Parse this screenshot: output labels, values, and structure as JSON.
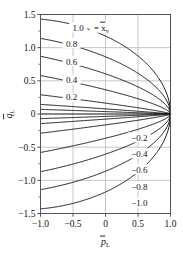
{
  "chart_data": {
    "type": "line",
    "title": "",
    "xlabel": "p̄L",
    "ylabel": "q̄L",
    "xlabel_base": "p",
    "xlabel_sub": "L",
    "ylabel_base": "q",
    "ylabel_sub": "L",
    "xlim": [
      -1.0,
      1.0
    ],
    "ylim": [
      -1.5,
      1.5
    ],
    "grid": true,
    "legend": "inline-curve-labels",
    "legend_title": "x̄v",
    "legend_title_base": "x",
    "legend_title_sub": "v",
    "annotation_equals": "=",
    "xticks": [
      "-1.0",
      "-0.5",
      "0",
      "0.5",
      "1.0"
    ],
    "xtick_values": [
      -1.0,
      -0.5,
      0,
      0.5,
      1.0
    ],
    "yticks": [
      "1.5",
      "1.0",
      "0.5",
      "0",
      "-0.5",
      "-1.0",
      "-1.5"
    ],
    "ytick_values": [
      1.5,
      1.0,
      0.5,
      0,
      -0.5,
      -1.0,
      -1.5
    ],
    "series": [
      {
        "name": "1.0",
        "label": "1.0",
        "label_x": -0.42,
        "label_y": 1.3,
        "start_y": 1.43
      },
      {
        "name": "0.8",
        "label": "0.8",
        "label_x": -0.52,
        "label_y": 1.06,
        "start_y": 1.14
      },
      {
        "name": "0.6",
        "label": "0.6",
        "label_x": -0.52,
        "label_y": 0.79,
        "start_y": 0.87
      },
      {
        "name": "0.4",
        "label": "0.4",
        "label_x": -0.52,
        "label_y": 0.51,
        "start_y": 0.58
      },
      {
        "name": "0.2",
        "label": "0.2",
        "label_x": -0.52,
        "label_y": 0.25,
        "start_y": 0.29
      },
      {
        "name": "0.1",
        "label": "",
        "label_x": 0,
        "label_y": 0,
        "start_y": 0.145
      },
      {
        "name": "0.05",
        "label": "",
        "label_x": 0,
        "label_y": 0,
        "start_y": 0.07
      },
      {
        "name": "0.0",
        "label": "",
        "label_x": 0,
        "label_y": 0,
        "start_y": 0.0
      },
      {
        "name": "-0.05",
        "label": "",
        "label_x": 0,
        "label_y": 0,
        "start_y": -0.07
      },
      {
        "name": "-0.1",
        "label": "",
        "label_x": 0,
        "label_y": 0,
        "start_y": -0.145
      },
      {
        "name": "-0.2",
        "label": "-0.2",
        "label_x": 0.52,
        "label_y": -0.36,
        "start_y": -0.29
      },
      {
        "name": "-0.4",
        "label": "-0.4",
        "label_x": 0.52,
        "label_y": -0.6,
        "start_y": -0.58
      },
      {
        "name": "-0.6",
        "label": "-0.6",
        "label_x": 0.52,
        "label_y": -0.84,
        "start_y": -0.87
      },
      {
        "name": "-0.8",
        "label": "-0.8",
        "label_x": 0.52,
        "label_y": -1.1,
        "start_y": -1.14
      },
      {
        "name": "-1.0",
        "label": "-1.0",
        "label_x": 0.52,
        "label_y": -1.34,
        "start_y": -1.43
      }
    ],
    "curve_note": "each series starts at x=-1 at start_y and decays to (1, 0)",
    "colors": {
      "curve": "#1a1a1a",
      "grid": "#b8b8b8",
      "frame": "#555555",
      "text": "#111111",
      "background": "#ffffff"
    }
  }
}
